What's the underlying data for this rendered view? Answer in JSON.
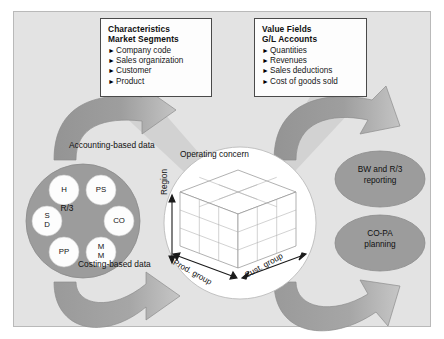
{
  "diagram": {
    "colors": {
      "panel_bg": "#e3e3e3",
      "panel_border": "#b9b9b9",
      "arrow_dark": "#9a9a9a",
      "arrow_light": "#c9c9c9",
      "circle_gray": "#9c9c9c",
      "beam_light": "#d5d5d5",
      "white": "#ffffff",
      "stroke": "#4a4a4a"
    },
    "boxes": [
      {
        "id": "characteristics",
        "heading1": "Characteristics",
        "heading2": "Market Segments",
        "bullet": "►",
        "items": [
          "Company code",
          "Sales organization",
          "Customer",
          "Product"
        ]
      },
      {
        "id": "value-fields",
        "heading1": "Value Fields",
        "heading2": "G/L Accounts",
        "bullet": "►",
        "items": [
          "Quantities",
          "Revenues",
          "Sales deductions",
          "Cost of goods sold"
        ]
      }
    ],
    "flow_labels": {
      "accounting": "Accounting-based data",
      "costing": "Costing-based data",
      "operating_concern": "Operating concern"
    },
    "r3": {
      "center_label": "R/3",
      "modules": [
        {
          "id": "hr",
          "label": "H"
        },
        {
          "id": "ps",
          "label": "PS"
        },
        {
          "id": "sd",
          "line1": "S",
          "line2": "D"
        },
        {
          "id": "co",
          "label": "CO"
        },
        {
          "id": "pp",
          "label": "PP"
        },
        {
          "id": "mm",
          "line1": "M",
          "line2": "M"
        }
      ]
    },
    "cube": {
      "axis_vertical": "Region",
      "axis_left": "Prod. group",
      "axis_right": "Cust. group",
      "divisions": 3
    },
    "outputs": [
      {
        "id": "bw-reporting",
        "line1": "BW and R/3",
        "line2": "reporting"
      },
      {
        "id": "copa-planning",
        "line1": "CO-PA",
        "line2": "planning"
      }
    ]
  }
}
